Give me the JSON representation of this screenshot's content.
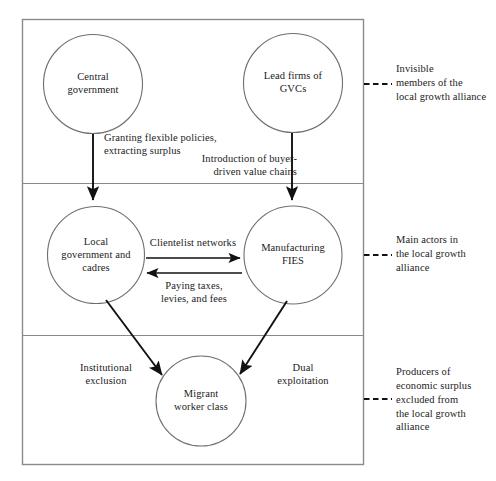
{
  "diagram": {
    "frame": {
      "stroke": "#8a8a8a",
      "fill": "#ffffff"
    },
    "arrow_color": "#111111",
    "circle_stroke": "#6f6f6f",
    "bands": [
      {
        "id": "band-invisible-members",
        "note_lines": "Invisible\nmembers of the\nlocal growth alliance"
      },
      {
        "id": "band-main-actors",
        "note_lines": "Main actors in\nthe local growth\nalliance"
      },
      {
        "id": "band-producers",
        "note_lines": "Producers of\neconomic surplus\nexcluded from\nthe local growth\nalliance"
      }
    ],
    "nodes": [
      {
        "id": "central-government",
        "label": "Central\ngovernment"
      },
      {
        "id": "lead-firms-gvcs",
        "label": "Lead firms of\nGVCs"
      },
      {
        "id": "local-government-cadres",
        "label": "Local\ngovernment and\ncadres"
      },
      {
        "id": "manufacturing-fies",
        "label": "Manufacturing\nFIES"
      },
      {
        "id": "migrant-worker-class",
        "label": "Migrant\nworker class"
      }
    ],
    "edges": [
      {
        "id": "edge-granting-policies",
        "label": "Granting flexible policies,\nextracting surplus",
        "from": "central-government",
        "to": "local-government-cadres"
      },
      {
        "id": "edge-buyer-driven-chains",
        "label": "Introduction of buyer-\ndriven value chains",
        "from": "lead-firms-gvcs",
        "to": "manufacturing-fies"
      },
      {
        "id": "edge-clientelist-networks",
        "label": "Clientelist networks",
        "from": "local-government-cadres",
        "to": "manufacturing-fies"
      },
      {
        "id": "edge-paying-taxes",
        "label": "Paying taxes,\nlevies, and fees",
        "from": "manufacturing-fies",
        "to": "local-government-cadres"
      },
      {
        "id": "edge-institutional-exclusion",
        "label": "Institutional\nexclusion",
        "from": "local-government-cadres",
        "to": "migrant-worker-class"
      },
      {
        "id": "edge-dual-exploitation",
        "label": "Dual\nexploitation",
        "from": "manufacturing-fies",
        "to": "migrant-worker-class"
      }
    ]
  }
}
